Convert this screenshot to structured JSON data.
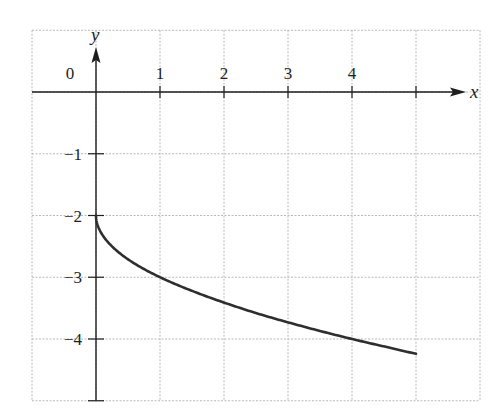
{
  "chart_data": {
    "type": "line",
    "title": "",
    "xlabel": "x",
    "ylabel": "y",
    "xlim": [
      -1,
      6
    ],
    "ylim": [
      -5,
      1
    ],
    "grid": true,
    "legend": null,
    "x_ticks": [
      {
        "value": 0,
        "label": "0"
      },
      {
        "value": 1,
        "label": "1"
      },
      {
        "value": 2,
        "label": "2"
      },
      {
        "value": 3,
        "label": "3"
      },
      {
        "value": 4,
        "label": "4"
      }
    ],
    "y_ticks": [
      {
        "value": -1,
        "label": "−1"
      },
      {
        "value": -2,
        "label": "−2"
      },
      {
        "value": -3,
        "label": "−3"
      },
      {
        "value": -4,
        "label": "−4"
      }
    ],
    "series": [
      {
        "name": "curve",
        "color": "#2e2e2e",
        "x": [
          0,
          0.05,
          0.25,
          0.5,
          1,
          1.5,
          2,
          2.5,
          3,
          3.5,
          4,
          4.5,
          5
        ],
        "y": [
          -2,
          -2.22,
          -2.5,
          -2.71,
          -3,
          -3.22,
          -3.41,
          -3.58,
          -3.73,
          -3.87,
          -4,
          -4.12,
          -4.24
        ]
      }
    ],
    "annotations": []
  },
  "colors": {
    "axis": "#1e1e1e",
    "grid": "#b8b8b8",
    "curve": "#2e2e2e",
    "background": "#ffffff"
  }
}
